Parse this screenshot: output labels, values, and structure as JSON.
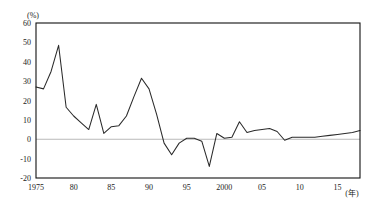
{
  "chart_data": {
    "type": "line",
    "title": "",
    "subtitle": "",
    "xlabel": "(年)",
    "ylabel": "(%)",
    "xlim": [
      1975,
      2018
    ],
    "ylim": [
      -20,
      60
    ],
    "grid": false,
    "legend": null,
    "zero_reference_line": true,
    "y_ticks": [
      60,
      50,
      40,
      30,
      20,
      10,
      0,
      -10,
      -20
    ],
    "y_tick_labels": [
      "60",
      "50",
      "40",
      "30",
      "20",
      "10",
      "0",
      "-10",
      "-20"
    ],
    "x_ticks": [
      1975,
      1980,
      1985,
      1990,
      1995,
      2000,
      2005,
      2010,
      2015
    ],
    "x_tick_labels": [
      "1975",
      "80",
      "85",
      "90",
      "95",
      "2000",
      "05",
      "10",
      "15"
    ],
    "x": [
      1975,
      1976,
      1977,
      1978,
      1979,
      1980,
      1981,
      1982,
      1983,
      1984,
      1985,
      1986,
      1987,
      1988,
      1989,
      1990,
      1991,
      1992,
      1993,
      1994,
      1995,
      1996,
      1997,
      1998,
      1999,
      2000,
      2001,
      2002,
      2003,
      2004,
      2005,
      2006,
      2007,
      2008,
      2009,
      2010,
      2011,
      2012,
      2013,
      2014,
      2015,
      2016,
      2017,
      2018
    ],
    "values": [
      27,
      26,
      35,
      48.5,
      16.5,
      12,
      8.5,
      5,
      18,
      3,
      6.5,
      7,
      12,
      22,
      31.5,
      26,
      13,
      -2,
      -8,
      -2,
      0.5,
      0.5,
      -1,
      -14,
      3,
      0.5,
      1,
      9,
      3.5,
      4.5,
      5,
      5.5,
      4,
      -0.5,
      1,
      1,
      1,
      1,
      1.5,
      2,
      2.5,
      3,
      3.5,
      4.5
    ],
    "series_name": "",
    "line_color": "#2a2a2a",
    "axis_color": "#111111",
    "zero_line_color": "#b9b9b9",
    "background_color": "#ffffff"
  },
  "axes": {
    "y_unit": "(%)",
    "x_unit": "(年)"
  }
}
